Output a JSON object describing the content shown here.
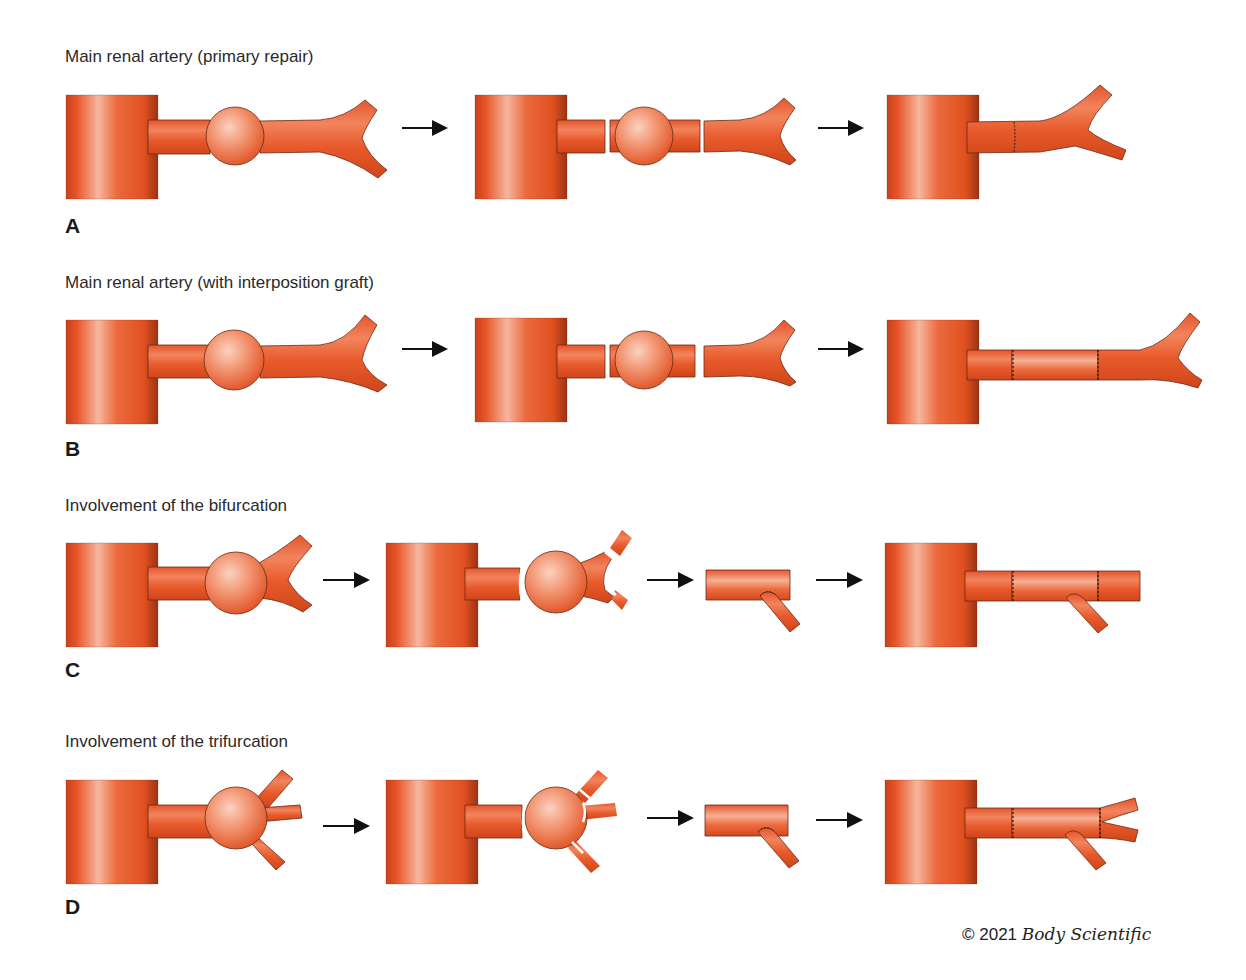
{
  "figure": {
    "colors": {
      "artery": "#e8552a",
      "artery_dark": "#b83a18",
      "artery_light": "#f7b59a",
      "outline": "#6a2a14",
      "arrow": "#111111",
      "cut_line": "#ffffff"
    },
    "rows": [
      {
        "letter": "A",
        "title": "Main renal artery (primary repair)",
        "steps": [
          "aneurysm",
          "excision",
          "end-to-end anastomosis"
        ]
      },
      {
        "letter": "B",
        "title": "Main renal artery (with interposition graft)",
        "steps": [
          "aneurysm",
          "excision",
          "interposition graft"
        ]
      },
      {
        "letter": "C",
        "title": "Involvement of the bifurcation",
        "steps": [
          "aneurysm at bifurcation",
          "excision",
          "branch reimplantation on graft",
          "graft anastomosed"
        ]
      },
      {
        "letter": "D",
        "title": "Involvement of the trifurcation",
        "steps": [
          "aneurysm at trifurcation",
          "excision",
          "branch reimplantation on graft",
          "graft anastomosed"
        ]
      }
    ],
    "copyright": {
      "symbol_year": "© 2021",
      "brand": "Body Scientific"
    }
  }
}
